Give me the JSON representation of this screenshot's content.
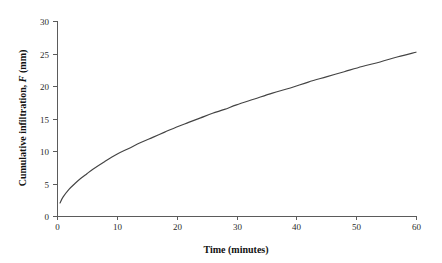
{
  "chart_data": {
    "type": "line",
    "title": "",
    "subtitle": "",
    "xlabel": "Time (minutes)",
    "ylabel": "Cumulative infiltration, F (mm)",
    "ylabel_parts": {
      "prefix": "Cumulative infiltration, ",
      "variable": "F",
      "suffix": " (mm)"
    },
    "xlim": [
      0,
      60
    ],
    "ylim": [
      0,
      30
    ],
    "xticks": [
      0,
      10,
      20,
      30,
      40,
      50,
      60
    ],
    "yticks": [
      0,
      5,
      10,
      15,
      20,
      25,
      30
    ],
    "xtick_labels": [
      "0",
      "10",
      "20",
      "30",
      "40",
      "50",
      "60"
    ],
    "ytick_labels": [
      "0",
      "5",
      "10",
      "15",
      "20",
      "25",
      "30"
    ],
    "grid": false,
    "legend": false,
    "legend_position": "none",
    "line_color": "#444444",
    "axis_color": "#5b5b5b",
    "background_color": "#ffffff",
    "series": [
      {
        "name": "Cumulative infiltration",
        "x": [
          0.5,
          1,
          2,
          3,
          4,
          5,
          6,
          8,
          10,
          12,
          14,
          16,
          18,
          20,
          22,
          24,
          26,
          28,
          30,
          33,
          36,
          39,
          42,
          45,
          48,
          51,
          54,
          57,
          60
        ],
        "values": [
          2.0,
          2.9,
          4.1,
          5.0,
          5.8,
          6.5,
          7.2,
          8.4,
          9.5,
          10.4,
          11.3,
          12.1,
          12.9,
          13.7,
          14.4,
          15.1,
          15.8,
          16.4,
          17.1,
          18.0,
          18.9,
          19.7,
          20.6,
          21.4,
          22.2,
          23.0,
          23.7,
          24.5,
          25.2
        ]
      }
    ],
    "annotations": []
  },
  "figure": {
    "plot_area": {
      "left": 57,
      "right": 416,
      "top": 21,
      "bottom": 216
    }
  }
}
